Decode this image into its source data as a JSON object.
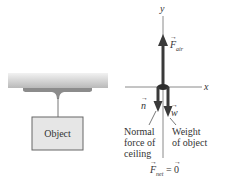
{
  "figure": {
    "left_panel": {
      "object_label": "Object",
      "ceiling_color_top": "#e4e4e4",
      "ceiling_color_bottom": "#b8b8b8",
      "box_fill": "#e6e6e6",
      "box_stroke": "#555555"
    },
    "right_panel": {
      "axes": {
        "x_label": "x",
        "y_label": "y"
      },
      "forces": [
        {
          "id": "F_air",
          "symbol": "F",
          "subscript": "air",
          "direction": "up"
        },
        {
          "id": "n",
          "symbol": "n",
          "direction": "down",
          "caption_lines": [
            "Normal",
            "force of",
            "ceiling"
          ]
        },
        {
          "id": "w",
          "symbol": "w",
          "direction": "down",
          "caption_lines": [
            "Weight",
            "of object"
          ]
        }
      ],
      "net_force": {
        "symbol": "F",
        "subscript": "net",
        "equals": "=",
        "value": "0"
      },
      "arrow_color": "#3a3a3a",
      "axis_color": "#888888"
    }
  }
}
